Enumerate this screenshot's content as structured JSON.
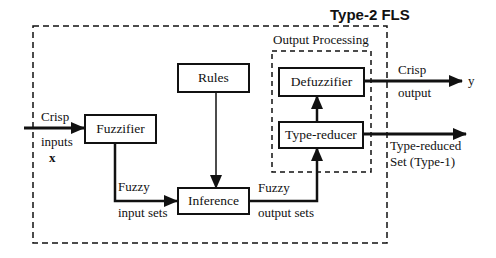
{
  "diagram": {
    "title": "Type-2 FLS",
    "subsystem_label": "Output Processing",
    "blocks": {
      "fuzzifier": "Fuzzifier",
      "rules": "Rules",
      "inference": "Inference",
      "defuzzifier": "Defuzzifier",
      "type_reducer": "Type-reducer"
    },
    "labels": {
      "crisp_inputs_line1": "Crisp",
      "crisp_inputs_line2": "inputs",
      "crisp_inputs_var": "x",
      "fuzzy_input_line1": "Fuzzy",
      "fuzzy_input_line2": "input sets",
      "fuzzy_output_line1": "Fuzzy",
      "fuzzy_output_line2": "output sets",
      "crisp_output_line1": "Crisp",
      "crisp_output_line2": "output",
      "output_var": "y",
      "type_reduced_line1": "Type-reduced",
      "type_reduced_line2": "Set (Type-1)"
    },
    "edges": [
      {
        "from": "x",
        "to": "Fuzzifier",
        "label": "Crisp inputs"
      },
      {
        "from": "Fuzzifier",
        "to": "Inference",
        "label": "Fuzzy input sets"
      },
      {
        "from": "Rules",
        "to": "Inference",
        "label": ""
      },
      {
        "from": "Inference",
        "to": "Type-reducer",
        "label": "Fuzzy output sets"
      },
      {
        "from": "Type-reducer",
        "to": "Defuzzifier",
        "label": ""
      },
      {
        "from": "Defuzzifier",
        "to": "y",
        "label": "Crisp output"
      },
      {
        "from": "Type-reducer",
        "to": "output",
        "label": "Type-reduced Set (Type-1)"
      }
    ],
    "colors": {
      "stroke": "#111111",
      "background": "#ffffff"
    }
  }
}
